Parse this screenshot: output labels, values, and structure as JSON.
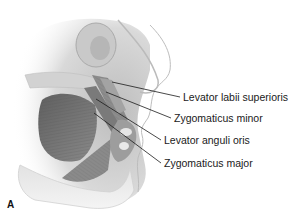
{
  "figure": {
    "panel_letter": "A"
  },
  "labels": [
    {
      "text": "Levator labii superioris",
      "x": 183,
      "y": 92,
      "line_from": [
        112,
        82
      ],
      "line_to": [
        180,
        97
      ]
    },
    {
      "text": "Zygomaticus minor",
      "x": 174,
      "y": 113,
      "line_from": [
        106,
        92
      ],
      "line_to": [
        171,
        118
      ]
    },
    {
      "text": "Levator anguli oris",
      "x": 164,
      "y": 135,
      "line_from": [
        96,
        99
      ],
      "line_to": [
        161,
        140
      ]
    },
    {
      "text": "Zygomaticus major",
      "x": 164,
      "y": 158,
      "line_from": [
        94,
        113
      ],
      "line_to": [
        161,
        163
      ]
    }
  ],
  "colors": {
    "background": "#ffffff",
    "muscle_dark": "#6e6e6e",
    "muscle_mid": "#9a9a9a",
    "skin_light": "#d8d8d8",
    "bone": "#c8c8c8",
    "leader_line": "#1a1a1a"
  }
}
